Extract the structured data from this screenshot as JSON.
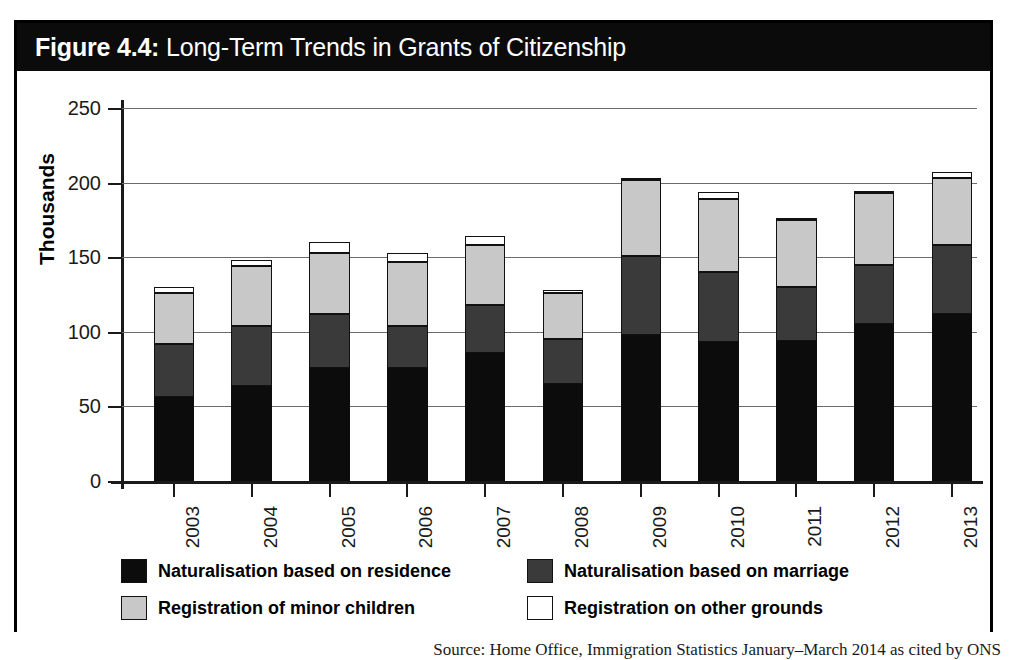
{
  "figure": {
    "number_label": "Figure 4.4:",
    "title": "Long-Term Trends in Grants of Citizenship",
    "source": "Source: Home Office, Immigration Statistics January–March 2014 as cited by ONS"
  },
  "chart_data": {
    "type": "bar",
    "subtype": "stacked-column",
    "title": "Long-Term Trends in Grants of Citizenship",
    "xlabel": "",
    "ylabel": "Thousands",
    "ylim": [
      0,
      250
    ],
    "yticks": [
      0,
      50,
      100,
      150,
      200,
      250
    ],
    "grid": true,
    "legend_position": "bottom",
    "categories": [
      "2003",
      "2004",
      "2005",
      "2006",
      "2007",
      "2008",
      "2009",
      "2010",
      "2011",
      "2012",
      "2013"
    ],
    "series": [
      {
        "name": "Naturalisation based on residence",
        "color": "#0c0c0c",
        "values": [
          56,
          64,
          76,
          76,
          86,
          65,
          98,
          93,
          94,
          105,
          112
        ]
      },
      {
        "name": "Naturalisation based on marriage",
        "color": "#3a3a3a",
        "values": [
          36,
          40,
          36,
          28,
          32,
          30,
          53,
          47,
          36,
          40,
          46
        ]
      },
      {
        "name": "Registration of minor children",
        "color": "#c8c8c8",
        "values": [
          34,
          40,
          41,
          43,
          40,
          31,
          51,
          49,
          45,
          48,
          45
        ]
      },
      {
        "name": "Registration on other grounds",
        "color": "#ffffff",
        "values": [
          4,
          4,
          7,
          6,
          6,
          2,
          1,
          5,
          1,
          1,
          4
        ]
      }
    ],
    "totals": [
      130,
      148,
      160,
      153,
      164,
      128,
      203,
      194,
      176,
      194,
      207
    ]
  },
  "legend": {
    "items": [
      {
        "label": "Naturalisation based on residence",
        "swatch": "#0c0c0c"
      },
      {
        "label": "Naturalisation based on marriage",
        "swatch": "#3a3a3a"
      },
      {
        "label": "Registration of minor children",
        "swatch": "#c8c8c8"
      },
      {
        "label": "Registration on other grounds",
        "swatch": "#ffffff"
      }
    ]
  }
}
